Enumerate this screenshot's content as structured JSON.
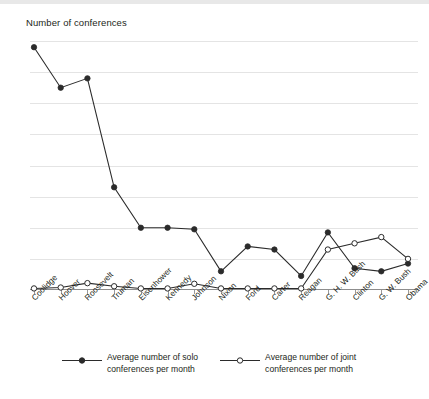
{
  "chart_data": {
    "type": "line",
    "title": "Number of conferences",
    "xlabel": "",
    "ylabel": "Number of conferences",
    "ylim": [
      0,
      8
    ],
    "grid": true,
    "legend_position": "bottom",
    "ytick_labels": [
      "8",
      "7",
      "5",
      "6",
      "4",
      "3",
      "2",
      "1",
      "0"
    ],
    "ytick_values": [
      8,
      7,
      6,
      5,
      4,
      3,
      2,
      1,
      0
    ],
    "categories": [
      "Coolidge",
      "Hoover",
      "Roosevelt",
      "Truman",
      "Eisenhower",
      "Kennedy",
      "Johnson",
      "Nixon",
      "Ford",
      "Carter",
      "Reagan",
      "G. H. W. Bush",
      "Clinton",
      "G. W. Bush",
      "Obama"
    ],
    "series": [
      {
        "name": "Average number of solo conferences per month",
        "marker": "filled-circle",
        "color": "#2b2b2b",
        "values": [
          7.8,
          6.5,
          6.8,
          3.3,
          2.0,
          2.0,
          1.95,
          0.6,
          1.4,
          1.3,
          0.45,
          1.85,
          0.7,
          0.6,
          0.85
        ]
      },
      {
        "name": "Average number of joint conferences per month",
        "marker": "open-circle",
        "color": "#2b2b2b",
        "values": [
          0.05,
          0.08,
          0.22,
          0.12,
          0.05,
          0.05,
          0.2,
          0.05,
          0.05,
          0.05,
          0.05,
          1.3,
          1.5,
          1.7,
          1.0
        ]
      }
    ]
  },
  "legend": {
    "entries": [
      {
        "label": "Average number of solo\nconferences per month",
        "marker": "filled-circle"
      },
      {
        "label": "Average number of joint\nconferences per month",
        "marker": "open-circle"
      }
    ]
  }
}
